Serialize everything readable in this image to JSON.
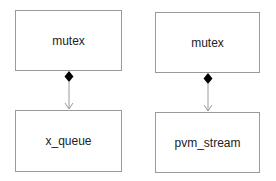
{
  "diagram": {
    "type": "uml-composition",
    "colors": {
      "border": "#9a9a9a",
      "text": "#222222",
      "diamond": "#000000",
      "arrow": "#9a9a9a"
    },
    "groups": [
      {
        "owner": {
          "label": "mutex"
        },
        "part": {
          "label": "x_queue"
        },
        "relation": "composition"
      },
      {
        "owner": {
          "label": "mutex"
        },
        "part": {
          "label": "pvm_stream"
        },
        "relation": "composition"
      }
    ]
  }
}
